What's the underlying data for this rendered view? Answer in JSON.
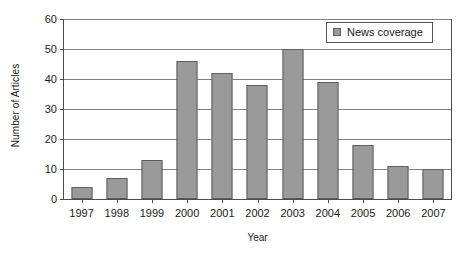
{
  "chart_data": {
    "type": "bar",
    "title": "",
    "xlabel": "Year",
    "ylabel": "Number of Articles",
    "categories": [
      "1997",
      "1998",
      "1999",
      "2000",
      "2001",
      "2002",
      "2003",
      "2004",
      "2005",
      "2006",
      "2007"
    ],
    "series": [
      {
        "name": "News coverage",
        "color": "#9a9a9a",
        "values": [
          4,
          7,
          13,
          46,
          42,
          38,
          50,
          39,
          18,
          11,
          10
        ]
      }
    ],
    "ylim": [
      0,
      60
    ],
    "ytick_values": [
      0,
      10,
      20,
      30,
      40,
      50,
      60
    ],
    "ytick_labels": [
      "0",
      "10",
      "20",
      "30",
      "40",
      "50",
      "60"
    ],
    "grid": "horizontal",
    "legend_position": "top-right"
  },
  "legend": {
    "entries": [
      {
        "label": "News coverage",
        "swatch": "legend-swatch-news-coverage"
      }
    ]
  }
}
